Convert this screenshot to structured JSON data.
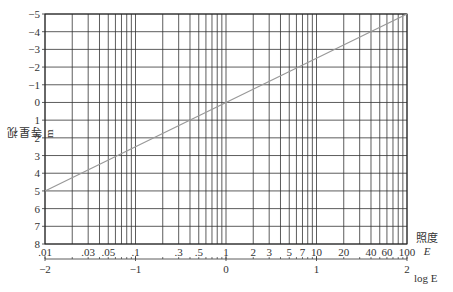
{
  "chart_data": {
    "type": "line",
    "title": "",
    "xlabel": "照度 E",
    "xlabel_secondary": "log E",
    "ylabel": "视星等 m",
    "x_scale": "log",
    "xlim": [
      0.01,
      100
    ],
    "ylim": [
      8,
      -5
    ],
    "y_inverted": true,
    "grid": true,
    "x_tick_labels": [
      ".01",
      ".03",
      ".05",
      ".1",
      ".3",
      ".5",
      "1",
      "2",
      "3",
      "5",
      "7",
      "10",
      "20",
      "40",
      "60",
      "100"
    ],
    "x_tick_values": [
      0.01,
      0.03,
      0.05,
      0.1,
      0.3,
      0.5,
      1,
      2,
      3,
      5,
      7,
      10,
      20,
      40,
      60,
      100
    ],
    "x_grid_values": [
      0.01,
      0.02,
      0.03,
      0.04,
      0.05,
      0.06,
      0.07,
      0.08,
      0.09,
      0.1,
      0.2,
      0.3,
      0.4,
      0.5,
      0.6,
      0.7,
      0.8,
      0.9,
      1,
      2,
      3,
      4,
      5,
      6,
      7,
      8,
      9,
      10,
      20,
      30,
      40,
      50,
      60,
      70,
      80,
      90,
      100
    ],
    "secondary_axis_ticks": [
      "-2",
      "-1",
      "0",
      "1",
      "2"
    ],
    "secondary_axis_values": [
      -2,
      -1,
      0,
      1,
      2
    ],
    "y_tick_labels": [
      "-5",
      "-4",
      "-3",
      "-2",
      "-1",
      "0",
      "1",
      "2",
      "3",
      "4",
      "5",
      "6",
      "7",
      "8"
    ],
    "y_tick_values": [
      -5,
      -4,
      -3,
      -2,
      -1,
      0,
      1,
      2,
      3,
      4,
      5,
      6,
      7,
      8
    ],
    "series": [
      {
        "name": "m = -2.5 log E",
        "x": [
          0.01,
          0.1,
          1,
          10,
          100
        ],
        "y": [
          5,
          2.5,
          0,
          -2.5,
          -5
        ],
        "color": "#999999"
      }
    ]
  },
  "labels": {
    "ylabel": "视星等 m",
    "xlabel_top": "照度",
    "xlabel_E": "E",
    "xlabel_log": "log E"
  }
}
